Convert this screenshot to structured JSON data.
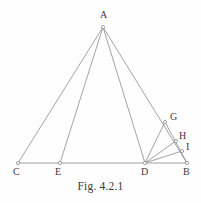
{
  "figure": {
    "caption": "Fig. 4.2.1",
    "stroke_color": "#8c8c8c",
    "marker_color": "#8c8c8c",
    "label_color": "#3a3a3a",
    "background_color": "#fefefe"
  },
  "chart_data": {
    "type": "diagram",
    "title": "Fig. 4.2.1",
    "subtype": "euclidean-geometry-construction",
    "points": [
      {
        "id": "A",
        "label": "A",
        "x": 103,
        "y": 27,
        "label_x": 100,
        "label_y": 10,
        "marker": true
      },
      {
        "id": "C",
        "label": "C",
        "x": 18,
        "y": 163,
        "label_x": 13,
        "label_y": 167,
        "marker": true
      },
      {
        "id": "E",
        "label": "E",
        "x": 60,
        "y": 163,
        "label_x": 55,
        "label_y": 167,
        "marker": true
      },
      {
        "id": "D",
        "label": "D",
        "x": 145,
        "y": 163,
        "label_x": 141,
        "label_y": 167,
        "marker": true
      },
      {
        "id": "B",
        "label": "B",
        "x": 187,
        "y": 163,
        "label_x": 183,
        "label_y": 167,
        "marker": true
      },
      {
        "id": "G",
        "label": "G",
        "x": 165,
        "y": 122,
        "label_x": 170,
        "label_y": 112,
        "marker": true
      },
      {
        "id": "H",
        "label": "H",
        "x": 176,
        "y": 141,
        "label_x": 179,
        "label_y": 131,
        "marker": true
      },
      {
        "id": "I",
        "label": "I",
        "x": 182,
        "y": 151,
        "label_x": 186,
        "label_y": 142,
        "marker": true
      }
    ],
    "segments": [
      {
        "id": "A-C",
        "from": "A",
        "to": "C"
      },
      {
        "id": "A-E",
        "from": "A",
        "to": "E"
      },
      {
        "id": "A-D",
        "from": "A",
        "to": "D"
      },
      {
        "id": "A-B",
        "from": "A",
        "to": "B"
      },
      {
        "id": "C-B",
        "from": "C",
        "to": "B"
      },
      {
        "id": "D-G",
        "from": "D",
        "to": "G"
      },
      {
        "id": "D-H",
        "from": "D",
        "to": "H"
      },
      {
        "id": "D-I",
        "from": "D",
        "to": "I"
      },
      {
        "id": "G-B",
        "from": "G",
        "to": "B"
      }
    ]
  }
}
